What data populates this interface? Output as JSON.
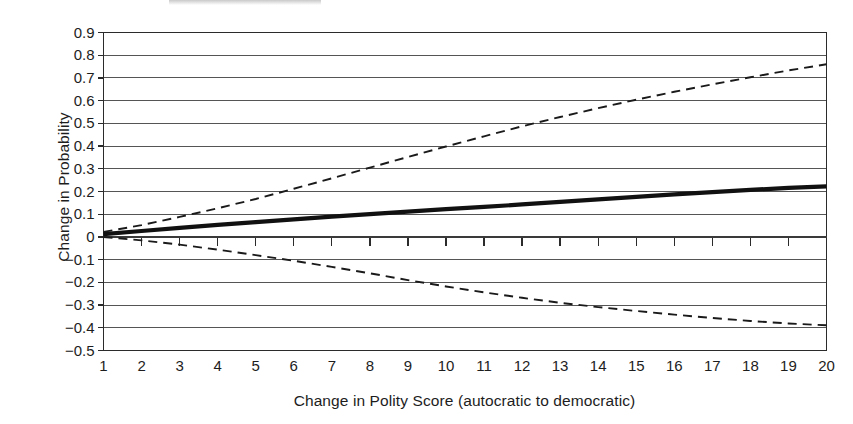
{
  "chart_data": {
    "type": "line",
    "title": "",
    "xlabel": "Change in Polity Score (autocratic to democratic)",
    "ylabel": "Change in Probability",
    "xlim": [
      1,
      20
    ],
    "ylim": [
      -0.5,
      0.9
    ],
    "grid": true,
    "grid_axis": "y",
    "legend": "none",
    "x_tick_labels": [
      "1",
      "2",
      "3",
      "4",
      "5",
      "6",
      "7",
      "8",
      "9",
      "10",
      "11",
      "12",
      "13",
      "14",
      "15",
      "16",
      "17",
      "18",
      "19",
      "20"
    ],
    "y_tick_labels": [
      "0.9",
      "0.8",
      "0.7",
      "0.6",
      "0.5",
      "0.4",
      "0.3",
      "0.2",
      "0.1",
      "0",
      "−0.1",
      "−0.2",
      "−0.3",
      "−0.4",
      "−0.5"
    ],
    "y_tick_values": [
      0.9,
      0.8,
      0.7,
      0.6,
      0.5,
      0.4,
      0.3,
      0.2,
      0.1,
      0,
      -0.1,
      -0.2,
      -0.3,
      -0.4,
      -0.5
    ],
    "x": [
      1,
      2,
      3,
      4,
      5,
      6,
      7,
      8,
      9,
      10,
      11,
      12,
      13,
      14,
      15,
      16,
      17,
      18,
      19,
      20
    ],
    "series": [
      {
        "name": "Point estimate",
        "style": "solid",
        "color": "#111111",
        "width": 4.2,
        "values": [
          0.012,
          0.026,
          0.04,
          0.053,
          0.065,
          0.077,
          0.089,
          0.1,
          0.111,
          0.122,
          0.132,
          0.143,
          0.154,
          0.165,
          0.176,
          0.187,
          0.197,
          0.207,
          0.216,
          0.223
        ]
      },
      {
        "name": "Upper 95% confidence bound",
        "style": "dashed",
        "color": "#1a1a1a",
        "width": 1.9,
        "values": [
          0.022,
          0.052,
          0.088,
          0.126,
          0.167,
          0.212,
          0.258,
          0.305,
          0.352,
          0.398,
          0.443,
          0.487,
          0.528,
          0.567,
          0.604,
          0.639,
          0.672,
          0.703,
          0.733,
          0.76
        ]
      },
      {
        "name": "Lower 95% confidence bound",
        "style": "dashed",
        "color": "#1a1a1a",
        "width": 1.9,
        "values": [
          0.0,
          -0.015,
          -0.034,
          -0.056,
          -0.08,
          -0.105,
          -0.132,
          -0.16,
          -0.19,
          -0.218,
          -0.244,
          -0.268,
          -0.29,
          -0.309,
          -0.326,
          -0.342,
          -0.357,
          -0.37,
          -0.381,
          -0.389
        ]
      }
    ]
  },
  "axes": {
    "y_title": "Change in Probability",
    "x_title": "Change in Polity Score (autocratic to democratic)"
  }
}
